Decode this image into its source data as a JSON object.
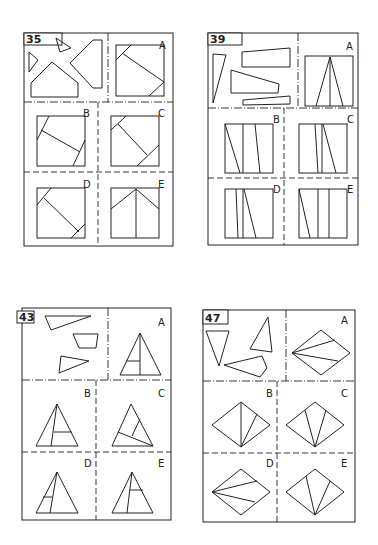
{
  "puzzles": [
    {
      "number": "35",
      "box": [
        24,
        33,
        173,
        246
      ],
      "numtab": [
        24,
        33,
        38,
        12
      ],
      "top_divider_y": 102,
      "top_vertical_x": 108,
      "lower_vertical_x": 98,
      "row_divider_y": 172,
      "pieces": [
        [
          [
            29,
            52
          ],
          [
            38,
            60
          ],
          [
            29,
            72
          ]
        ],
        [
          [
            56,
            38
          ],
          [
            71,
            48
          ],
          [
            60,
            52
          ]
        ],
        [
          [
            52,
            62
          ],
          [
            78,
            83
          ],
          [
            78,
            97
          ],
          [
            31,
            97
          ],
          [
            31,
            83
          ]
        ],
        [
          [
            93,
            40
          ],
          [
            102,
            40
          ],
          [
            102,
            88
          ],
          [
            93,
            88
          ],
          [
            70,
            63
          ]
        ]
      ],
      "options": [
        {
          "label": "A",
          "lx": 163,
          "ly": 45,
          "square": [
            116,
            45,
            164,
            96
          ],
          "lines": [
            [
              [
                116,
                60
              ],
              [
                131,
                45
              ]
            ],
            [
              [
                122,
                53
              ],
              [
                164,
                82
              ]
            ],
            [
              [
                149,
                96
              ],
              [
                164,
                82
              ]
            ]
          ]
        },
        {
          "label": "B",
          "lx": 87,
          "ly": 113,
          "square": [
            37,
            116,
            85,
            166
          ],
          "lines": [
            [
              [
                37,
                140
              ],
              [
                49,
                116
              ]
            ],
            [
              [
                41,
                130
              ],
              [
                80,
                152
              ]
            ],
            [
              [
                73,
                166
              ],
              [
                85,
                140
              ]
            ]
          ]
        },
        {
          "label": "C",
          "lx": 162,
          "ly": 113,
          "square": [
            111,
            116,
            159,
            166
          ],
          "lines": [
            [
              [
                111,
                130
              ],
              [
                126,
                116
              ]
            ],
            [
              [
                118,
                124
              ],
              [
                147,
                155
              ]
            ],
            [
              [
                137,
                166
              ],
              [
                159,
                145
              ]
            ]
          ]
        },
        {
          "label": "D",
          "lx": 87,
          "ly": 184,
          "square": [
            37,
            188,
            85,
            238
          ],
          "lines": [
            [
              [
                37,
                205
              ],
              [
                51,
                188
              ]
            ],
            [
              [
                44,
                198
              ],
              [
                79,
                232
              ]
            ],
            [
              [
                71,
                238
              ],
              [
                85,
                224
              ]
            ]
          ]
        },
        {
          "label": "E",
          "lx": 162,
          "ly": 184,
          "square": [
            111,
            188,
            159,
            238
          ],
          "lines": [
            [
              [
                111,
                209
              ],
              [
                136,
                189
              ]
            ],
            [
              [
                136,
                189
              ],
              [
                159,
                209
              ]
            ],
            [
              [
                136,
                189
              ],
              [
                136,
                238
              ]
            ]
          ]
        }
      ]
    },
    {
      "number": "39",
      "box": [
        208,
        33,
        358,
        245
      ],
      "numtab": [
        208,
        33,
        34,
        12
      ],
      "top_divider_y": 108,
      "top_vertical_x": 298,
      "lower_vertical_x": 284,
      "row_divider_y": 178,
      "pieces": [
        [
          [
            213,
            54
          ],
          [
            226,
            55
          ],
          [
            213,
            103
          ]
        ],
        [
          [
            242,
            52
          ],
          [
            290,
            48
          ],
          [
            290,
            67
          ],
          [
            242,
            67
          ]
        ],
        [
          [
            231,
            70
          ],
          [
            279,
            84
          ],
          [
            278,
            93
          ],
          [
            231,
            93
          ]
        ],
        [
          [
            243,
            100
          ],
          [
            290,
            96
          ],
          [
            290,
            104
          ],
          [
            243,
            105
          ]
        ]
      ],
      "options": [
        {
          "label": "A",
          "lx": 350,
          "ly": 46,
          "square": [
            305,
            56,
            353,
            106
          ],
          "lines": [
            [
              [
                330,
                57
              ],
              [
                316,
                106
              ]
            ],
            [
              [
                330,
                57
              ],
              [
                343,
                106
              ]
            ],
            [
              [
                330,
                57
              ],
              [
                330,
                106
              ]
            ]
          ]
        },
        {
          "label": "B",
          "lx": 277,
          "ly": 119,
          "square": [
            225,
            124,
            273,
            173
          ],
          "lines": [
            [
              [
                225,
                124
              ],
              [
                240,
                173
              ]
            ],
            [
              [
                243,
                124
              ],
              [
                243,
                173
              ]
            ],
            [
              [
                255,
                124
              ],
              [
                260,
                173
              ]
            ]
          ]
        },
        {
          "label": "C",
          "lx": 351,
          "ly": 119,
          "square": [
            299,
            124,
            347,
            173
          ],
          "lines": [
            [
              [
                315,
                124
              ],
              [
                318,
                173
              ]
            ],
            [
              [
                322,
                124
              ],
              [
                322,
                173
              ]
            ],
            [
              [
                323,
                124
              ],
              [
                336,
                173
              ]
            ]
          ]
        },
        {
          "label": "D",
          "lx": 277,
          "ly": 189,
          "square": [
            225,
            189,
            273,
            238
          ],
          "lines": [
            [
              [
                236,
                189
              ],
              [
                238,
                238
              ]
            ],
            [
              [
                243,
                189
              ],
              [
                243,
                238
              ]
            ],
            [
              [
                244,
                189
              ],
              [
                256,
                238
              ]
            ]
          ]
        },
        {
          "label": "E",
          "lx": 351,
          "ly": 189,
          "square": [
            299,
            189,
            347,
            238
          ],
          "lines": [
            [
              [
                299,
                189
              ],
              [
                310,
                238
              ]
            ],
            [
              [
                318,
                189
              ],
              [
                318,
                238
              ]
            ],
            [
              [
                329,
                189
              ],
              [
                329,
                238
              ]
            ]
          ]
        }
      ]
    },
    {
      "number": "43",
      "box": [
        22,
        308,
        171,
        520
      ],
      "numtab": [
        17,
        311,
        17,
        12
      ],
      "top_divider_y": 380,
      "top_vertical_x": 108,
      "lower_vertical_x": 96,
      "row_divider_y": 452,
      "pieces": [
        [
          [
            45,
            316
          ],
          [
            91,
            316
          ],
          [
            51,
            330
          ]
        ],
        [
          [
            73,
            334
          ],
          [
            98,
            334
          ],
          [
            96,
            348
          ],
          [
            79,
            348
          ]
        ],
        [
          [
            61,
            356
          ],
          [
            89,
            361
          ],
          [
            59,
            373
          ]
        ]
      ],
      "options": [
        {
          "label": "A",
          "lx": 162,
          "ly": 322,
          "tri": [
            [
              140,
              333
            ],
            [
              120,
              375
            ],
            [
              161,
              375
            ]
          ],
          "lines": [
            [
              [
                140,
                333
              ],
              [
                140,
                375
              ]
            ],
            [
              [
                127,
                361
              ],
              [
                140,
                361
              ]
            ]
          ]
        },
        {
          "label": "B",
          "lx": 88,
          "ly": 393,
          "tri": [
            [
              57,
              404
            ],
            [
              36,
              446
            ],
            [
              78,
              446
            ]
          ],
          "lines": [
            [
              [
                57,
                404
              ],
              [
                51,
                446
              ]
            ],
            [
              [
                54,
                432
              ],
              [
                72,
                432
              ]
            ],
            [
              [
                54,
                432
              ],
              [
                54,
                432
              ]
            ]
          ]
        },
        {
          "label": "C",
          "lx": 162,
          "ly": 393,
          "tri": [
            [
              131,
              404
            ],
            [
              112,
              446
            ],
            [
              153,
              446
            ]
          ],
          "lines": [
            [
              [
                118,
                432
              ],
              [
                153,
                446
              ]
            ],
            [
              [
                132,
                436
              ],
              [
                140,
                419
              ]
            ]
          ]
        },
        {
          "label": "D",
          "lx": 88,
          "ly": 463,
          "tri": [
            [
              57,
              472
            ],
            [
              36,
              513
            ],
            [
              78,
              513
            ]
          ],
          "lines": [
            [
              [
                57,
                472
              ],
              [
                50,
                513
              ]
            ],
            [
              [
                43,
                497
              ],
              [
                52,
                497
              ]
            ]
          ]
        },
        {
          "label": "E",
          "lx": 162,
          "ly": 463,
          "tri": [
            [
              132,
              472
            ],
            [
              112,
              513
            ],
            [
              153,
              513
            ]
          ],
          "lines": [
            [
              [
                132,
                472
              ],
              [
                127,
                513
              ]
            ],
            [
              [
                130,
                490
              ],
              [
                143,
                490
              ]
            ]
          ]
        }
      ]
    },
    {
      "number": "47",
      "box": [
        203,
        310,
        355,
        522
      ],
      "numtab": [
        203,
        310,
        25,
        14
      ],
      "top_divider_y": 381,
      "top_vertical_x": 286,
      "lower_vertical_x": 277,
      "row_divider_y": 453,
      "pieces": [
        [
          [
            206,
            331
          ],
          [
            229,
            331
          ],
          [
            219,
            366
          ]
        ],
        [
          [
            268,
            317
          ],
          [
            272,
            352
          ],
          [
            250,
            349
          ]
        ],
        [
          [
            224,
            365
          ],
          [
            262,
            356
          ],
          [
            267,
            368
          ],
          [
            260,
            377
          ]
        ],
        [
          [
            224,
            365
          ],
          [
            224,
            365
          ]
        ]
      ],
      "options": [
        {
          "label": "A",
          "lx": 345,
          "ly": 320,
          "diamond": [
            [
              321,
              330
            ],
            [
              350,
              353
            ],
            [
              321,
              375
            ],
            [
              292,
              353
            ]
          ],
          "lines": [
            [
              [
                292,
                353
              ],
              [
                335,
                340
              ]
            ],
            [
              [
                292,
                353
              ],
              [
                338,
                361
              ]
            ]
          ]
        },
        {
          "label": "B",
          "lx": 270,
          "ly": 393,
          "diamond": [
            [
              241,
              402
            ],
            [
              270,
              425
            ],
            [
              241,
              447
            ],
            [
              212,
              425
            ]
          ],
          "lines": [
            [
              [
                241,
                402
              ],
              [
                241,
                447
              ]
            ],
            [
              [
                241,
                447
              ],
              [
                257,
                414
              ]
            ]
          ]
        },
        {
          "label": "C",
          "lx": 345,
          "ly": 393,
          "diamond": [
            [
              315,
              402
            ],
            [
              344,
              425
            ],
            [
              315,
              447
            ],
            [
              286,
              425
            ]
          ],
          "lines": [
            [
              [
                305,
                410
              ],
              [
                315,
                447
              ]
            ],
            [
              [
                326,
                410
              ],
              [
                315,
                447
              ]
            ]
          ]
        },
        {
          "label": "D",
          "lx": 270,
          "ly": 463,
          "diamond": [
            [
              241,
              469
            ],
            [
              270,
              492
            ],
            [
              241,
              515
            ],
            [
              212,
              492
            ]
          ],
          "lines": [
            [
              [
                212,
                492
              ],
              [
                257,
                481
              ]
            ],
            [
              [
                212,
                492
              ],
              [
                255,
                502
              ]
            ]
          ]
        },
        {
          "label": "E",
          "lx": 345,
          "ly": 463,
          "diamond": [
            [
              315,
              469
            ],
            [
              344,
              492
            ],
            [
              315,
              515
            ],
            [
              286,
              492
            ]
          ],
          "lines": [
            [
              [
                306,
                476
              ],
              [
                315,
                515
              ]
            ],
            [
              [
                330,
                481
              ],
              [
                315,
                515
              ]
            ]
          ]
        }
      ]
    }
  ]
}
